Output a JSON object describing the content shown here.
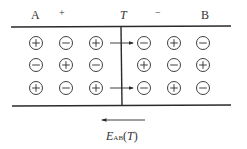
{
  "labels": {
    "left_metal": "A",
    "left_sign": "+",
    "junction": "T",
    "right_sign": "−",
    "right_metal": "B"
  },
  "field": {
    "symbol": "E",
    "subscript": "AB",
    "argument": "(T)",
    "direction": "right-to-left"
  },
  "grid": {
    "left": [
      [
        "+",
        "−",
        "+"
      ],
      [
        "−",
        "+",
        "−"
      ],
      [
        "+",
        "−",
        "+"
      ]
    ],
    "right": [
      [
        "−",
        "+",
        "−"
      ],
      [
        "+",
        "−",
        "+"
      ],
      [
        "−",
        "+",
        "−"
      ]
    ]
  },
  "diffusion_arrows": [
    {
      "row": 1,
      "from": "left",
      "to": "right"
    },
    {
      "row": 3,
      "from": "left",
      "to": "right"
    }
  ],
  "colors": {
    "line": "#2a2a2a",
    "text": "#333333"
  }
}
